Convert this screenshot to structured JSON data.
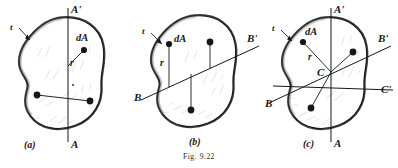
{
  "figure": {
    "caption_prefix": "Fig.",
    "caption_number": "9.22",
    "background_color": "#ffffff",
    "ink_color": "#171717",
    "fill_color": "#ffffff",
    "rim_color": "#4a4a4a"
  },
  "panels": [
    {
      "id": "a",
      "caption": "(a)",
      "thickness_label": "t",
      "element_label": "dA",
      "radius_label": "r",
      "axes": [
        {
          "name": "A-A'",
          "top_label": "A'",
          "bottom_label": "A",
          "orientation": "vertical"
        }
      ],
      "markers": [
        {
          "name": "dA-marker"
        },
        {
          "name": "element-marker-left"
        },
        {
          "name": "element-marker-right"
        }
      ]
    },
    {
      "id": "b",
      "caption": "(b)",
      "thickness_label": "t",
      "element_label": "dA",
      "radius_label": "r",
      "axes": [
        {
          "name": "B-B'",
          "left_label": "B",
          "right_label": "B'",
          "orientation": "inclined"
        }
      ],
      "markers": [
        {
          "name": "dA-marker"
        },
        {
          "name": "element-marker-upper"
        },
        {
          "name": "element-marker-lower"
        }
      ]
    },
    {
      "id": "c",
      "caption": "(c)",
      "thickness_label": "t",
      "element_label": "dA",
      "radius_label": "r",
      "centroid_label": "C",
      "axes": [
        {
          "name": "A-A'",
          "top_label": "A'",
          "bottom_label": "A",
          "orientation": "vertical"
        },
        {
          "name": "B-B'",
          "left_label": "B",
          "right_label": "B'",
          "orientation": "inclined"
        },
        {
          "name": "C-C'",
          "right_label": "C'",
          "orientation": "inclined-shallow"
        }
      ],
      "markers": [
        {
          "name": "dA-marker"
        },
        {
          "name": "element-marker-right"
        },
        {
          "name": "element-marker-lower-left"
        }
      ]
    }
  ]
}
